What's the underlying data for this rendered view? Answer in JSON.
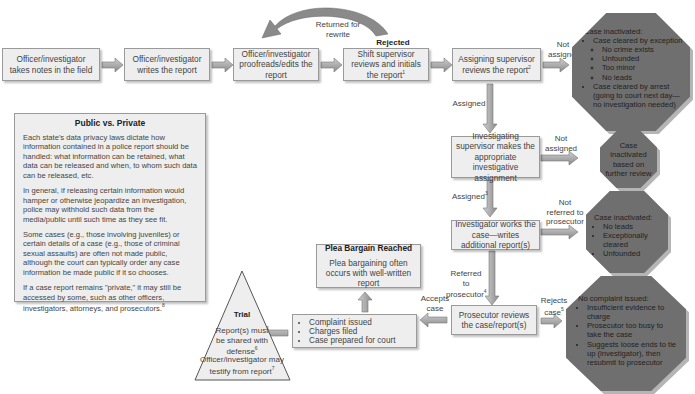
{
  "flow": {
    "take_notes": "Officer/investigator takes notes in the field",
    "writes_report": "Officer/investigator writes the report",
    "proofreads": "Officer/investigator proofreads/edits the report",
    "shift_supervisor": "Shift supervisor reviews and initials the report",
    "shift_supervisor_sup": "1",
    "assigning_supervisor": "Assigning supervisor reviews the report",
    "assigning_supervisor_sup": "2",
    "investigating_supervisor": "Investigating supervisor makes the appropriate investigative assignment",
    "investigator_works": "Investigator works the case—writes additional report(s)",
    "prosecutor_reviews": "Prosecutor reviews the case/report(s)"
  },
  "labels": {
    "returned_for_rewrite": "Returned for rewrite",
    "rejected": "Rejected",
    "not_assigned_1": "Not assigned",
    "assigned": "Assigned",
    "not_assigned_2": "Not assigned",
    "assigned_3": "Assigned",
    "assigned_3_sup": "3",
    "not_referred": "Not referred to prosecutor",
    "referred": "Referred to prosecutor",
    "referred_sup": "4",
    "accepts_case": "Accepts case",
    "rejects_case": "Rejects case",
    "rejects_case_sup": "5"
  },
  "octagons": {
    "inactivated_1": {
      "title": "Case inactivated:",
      "items": [
        {
          "text": "Case cleared by exception",
          "sub": [
            "No crime exists",
            "Unfounded",
            "Too minor",
            "No leads"
          ]
        },
        {
          "text": "Case cleared by arrest (going to court next day—no investigation needed)",
          "sub": []
        }
      ]
    },
    "inactivated_2": {
      "text": "Case inactivated based on further review"
    },
    "inactivated_3": {
      "title": "Case inactivated:",
      "items": [
        "No leads",
        "Exceptionally cleared",
        "Unfounded"
      ]
    },
    "no_complaint": {
      "title": "No complaint issued:",
      "items": [
        "Insufficient evidence to charge",
        "Prosecutor too busy to take the case",
        "Suggests loose ends to tie up (investigator), then resubmit to prosecutor"
      ]
    }
  },
  "accepted": {
    "items": [
      "Complaint issued",
      "Charges filed",
      "Case prepared for court"
    ]
  },
  "plea": {
    "title": "Plea Bargain Reached",
    "text": "Plea bargaining often occurs with well-written report"
  },
  "trial": {
    "title": "Trial",
    "line1": "Report(s) must be shared with defense",
    "line1_sup": "6",
    "line2": "Officer/investigator may testify from report",
    "line2_sup": "7"
  },
  "sidebar": {
    "title": "Public vs. Private",
    "paragraphs": [
      "Each state's data privacy laws dictate how information contained in a police report should be handled: what information can be retained, what data can be released and when, to whom such data can be released, etc.",
      "In general, if releasing certain information would hamper or otherwise jeopardize an investigation, police may withhold such data from the media/public until such time as they see fit.",
      "Some cases (e.g., those involving juveniles) or certain details of a case (e.g., those of criminal sexual assaults) are often not made public, although the court can typically order any case information be made public if it so chooses.",
      "If a case report remains \"private,\" it may still be accessed by some, such as other officers, investigators, attorneys, and prosecutors."
    ],
    "last_sup": "8"
  }
}
